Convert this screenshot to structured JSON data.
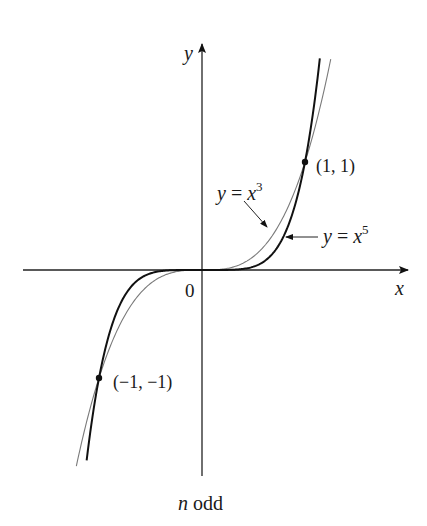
{
  "chart_data": {
    "type": "line",
    "title": "",
    "caption": "n odd",
    "caption_italic_part": "n",
    "caption_rest": " odd",
    "xlabel": "x",
    "ylabel": "y",
    "origin_label": "0",
    "xlim": [
      -1.75,
      1.95
    ],
    "ylim": [
      -1.9,
      2.0
    ],
    "grid": false,
    "legend": "none (inline labels with arrows)",
    "series": [
      {
        "name": "y = x^3",
        "label_prefix": "y = x",
        "label_exp": "3",
        "function": "x^3",
        "style": "thin gray",
        "color": "#7a7a7a",
        "x_range": [
          -1.22,
          1.25
        ],
        "sample_points": [
          [
            -1.2,
            -1.728
          ],
          [
            -1,
            -1
          ],
          [
            -0.5,
            -0.125
          ],
          [
            0,
            0
          ],
          [
            0.5,
            0.125
          ],
          [
            1,
            1
          ],
          [
            1.25,
            1.953
          ]
        ]
      },
      {
        "name": "y = x^5",
        "label_prefix": "y = x",
        "label_exp": "5",
        "function": "x^5",
        "style": "thick black",
        "color": "#111111",
        "x_range": [
          -1.12,
          1.144
        ],
        "sample_points": [
          [
            -1.12,
            -1.762
          ],
          [
            -1,
            -1
          ],
          [
            -0.5,
            -0.03125
          ],
          [
            0,
            0
          ],
          [
            0.5,
            0.03125
          ],
          [
            1,
            1
          ],
          [
            1.144,
            1.96
          ]
        ]
      }
    ],
    "annotations": [
      {
        "text": "(1, 1)",
        "x": 1,
        "y": 1,
        "marker": "dot"
      },
      {
        "text": "(−1, −1)",
        "x": -1,
        "y": -1,
        "marker": "dot"
      }
    ]
  }
}
